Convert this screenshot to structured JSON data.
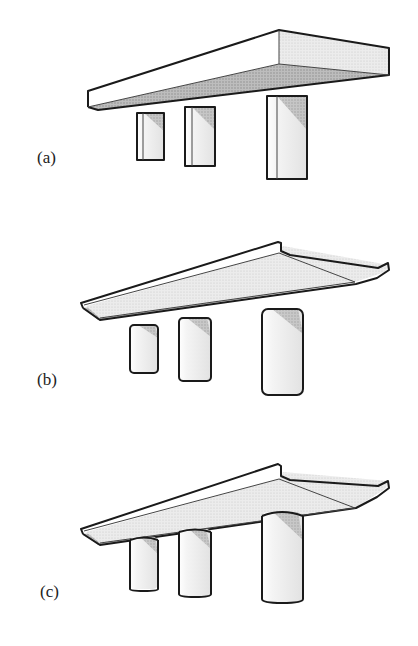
{
  "figure": {
    "panels": [
      {
        "label": "(a)",
        "deck": "rectangular slab deck",
        "piers": "rectangular piers, detached from deck"
      },
      {
        "label": "(b)",
        "deck": "cantilevered slab deck with upturned edges",
        "piers": "rounded-rectangle piers, detached from deck"
      },
      {
        "label": "(c)",
        "deck": "cantilevered slab deck with upturned edges",
        "piers": "rounded piers connected to deck soffit"
      }
    ]
  },
  "colors": {
    "outline": "#1a1a1a",
    "light_face": "#ffffff",
    "shaded_face": "#e6e6e6",
    "dark_face": "#b5b5b5",
    "background": "#ffffff"
  }
}
